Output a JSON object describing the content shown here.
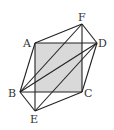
{
  "diagram": {
    "type": "geometry-figure",
    "shaded_region": "square-ABCD-face",
    "shade_color": "#d9d9d9",
    "line_color": "#222222",
    "points": [
      "A",
      "B",
      "C",
      "D",
      "E",
      "F"
    ],
    "labels": {
      "A": "A",
      "B": "B",
      "C": "C",
      "D": "D",
      "E": "E",
      "F": "F"
    },
    "edges": [
      [
        "A",
        "F"
      ],
      [
        "F",
        "D"
      ],
      [
        "D",
        "C"
      ],
      [
        "C",
        "E"
      ],
      [
        "E",
        "B"
      ],
      [
        "B",
        "A"
      ],
      [
        "A",
        "D"
      ],
      [
        "B",
        "C"
      ],
      [
        "F",
        "C"
      ],
      [
        "A",
        "E"
      ],
      [
        "B",
        "F"
      ],
      [
        "B",
        "D"
      ],
      [
        "E",
        "D"
      ]
    ]
  }
}
